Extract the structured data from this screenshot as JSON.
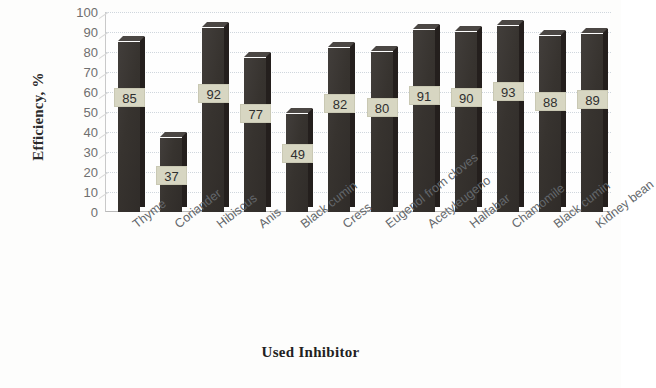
{
  "chart_data": {
    "type": "bar",
    "title": "",
    "xlabel": "Used Inhibitor",
    "ylabel": "Efficiency, %",
    "categories": [
      "Thyme",
      "Coriander",
      "Hibiscus",
      "Anis",
      "Black cumin",
      "Cress",
      "Eugenol from cloves",
      "Acetyleugeno",
      "Halfabar",
      "Chamomile",
      "Black cumin",
      "Kidney bean"
    ],
    "values": [
      85,
      37,
      92,
      77,
      49,
      82,
      80,
      91,
      90,
      93,
      88,
      89
    ],
    "ylim": [
      0,
      100
    ],
    "ytick_labels": [
      "100",
      "90",
      "80",
      "70",
      "60",
      "50",
      "40",
      "30",
      "20",
      "10",
      "0"
    ],
    "ytick_values": [
      100,
      90,
      80,
      70,
      60,
      50,
      40,
      30,
      20,
      10,
      0
    ],
    "grid": true,
    "legend": false,
    "legend_position": "none",
    "data_labels": true,
    "bar_color": "#3a3634",
    "label_box_color": "#d7d6c2",
    "gridline_color": "#cfd6dd",
    "axis_text_color": "#6f6f6f",
    "style_3d": true
  }
}
